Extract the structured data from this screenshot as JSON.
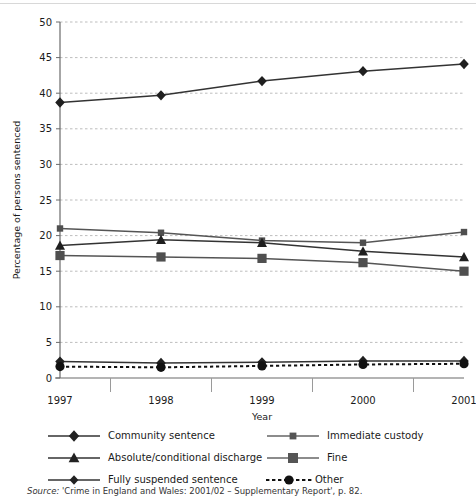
{
  "chart_data": {
    "type": "line",
    "title": "",
    "xlabel": "Year",
    "ylabel": "Percentage of persons sentenced",
    "categories": [
      "1997",
      "1998",
      "1999",
      "2000",
      "2001"
    ],
    "x": [
      1997,
      1998,
      1999,
      2000,
      2001
    ],
    "ylim": [
      0,
      50
    ],
    "yticks": [
      0,
      5,
      10,
      15,
      20,
      25,
      30,
      35,
      40,
      45,
      50
    ],
    "grid": true,
    "legend_position": "bottom",
    "series": [
      {
        "name": "Community sentence",
        "marker": "diamond",
        "linestyle": "solid",
        "color": "#333333",
        "values": [
          38.7,
          39.7,
          41.7,
          43.1,
          44.1
        ]
      },
      {
        "name": "Immediate custody",
        "marker": "small-square",
        "linestyle": "solid",
        "color": "#555555",
        "values": [
          21.0,
          20.4,
          19.3,
          19.0,
          20.5
        ]
      },
      {
        "name": "Absolute/conditional discharge",
        "marker": "triangle",
        "linestyle": "solid",
        "color": "#333333",
        "values": [
          18.6,
          19.4,
          19.0,
          17.8,
          17.0
        ]
      },
      {
        "name": "Fine",
        "marker": "large-square",
        "linestyle": "solid",
        "color": "#555555",
        "values": [
          17.2,
          17.0,
          16.8,
          16.2,
          15.0
        ]
      },
      {
        "name": "Fully suspended sentence",
        "marker": "diamond",
        "linestyle": "solid",
        "color": "#333333",
        "values": [
          2.3,
          2.1,
          2.2,
          2.4,
          2.4
        ]
      },
      {
        "name": "Other",
        "marker": "circle",
        "linestyle": "dotted",
        "color": "#111111",
        "values": [
          1.6,
          1.5,
          1.7,
          1.9,
          2.0
        ]
      }
    ]
  },
  "axis": {
    "y_label": "Percentage of persons sentenced",
    "x_label": "Year",
    "y_ticks": [
      "0",
      "5",
      "10",
      "15",
      "20",
      "25",
      "30",
      "35",
      "40",
      "45",
      "50"
    ],
    "x_ticks": [
      "1997",
      "1998",
      "1999",
      "2000",
      "2001"
    ]
  },
  "legend": {
    "items": [
      {
        "label": "Community sentence",
        "marker": "diamond",
        "linestyle": "solid"
      },
      {
        "label": "Immediate custody",
        "marker": "small-square",
        "linestyle": "solid"
      },
      {
        "label": "Absolute/conditional discharge",
        "marker": "triangle",
        "linestyle": "solid"
      },
      {
        "label": "Fine",
        "marker": "large-square",
        "linestyle": "solid"
      },
      {
        "label": "Fully suspended sentence",
        "marker": "diamond",
        "linestyle": "solid"
      },
      {
        "label": "Other",
        "marker": "circle",
        "linestyle": "dotted"
      }
    ]
  },
  "footer": {
    "source_prefix": "Source:",
    "source_text": " 'Crime in England and Wales: 2001/02 – Supplementary Report', p. 82."
  },
  "colors": {
    "line": "#333333",
    "grid": "#bdbdbd",
    "axis": "#6b6b6b",
    "text": "#1a1a1a"
  }
}
